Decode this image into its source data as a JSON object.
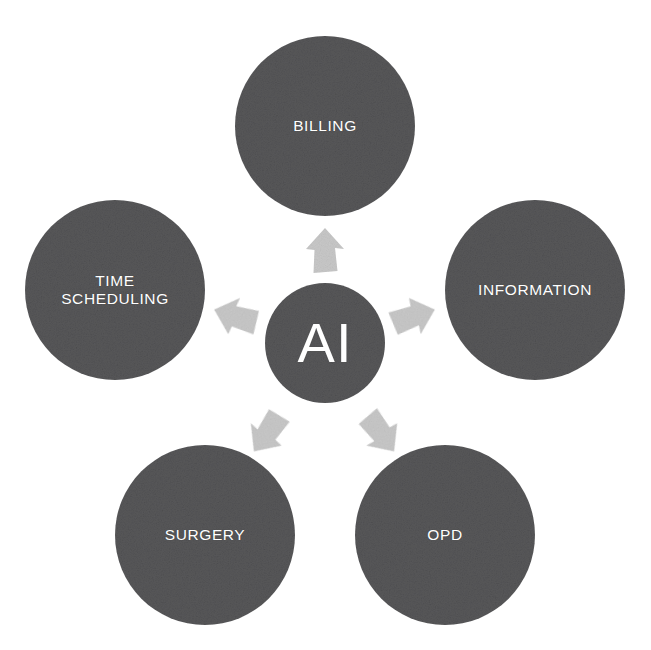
{
  "diagram": {
    "type": "hub-and-spoke radial diagram",
    "background_color": "#ffffff",
    "node_fill_color": "#58585a",
    "node_text_color": "#ffffff",
    "arrow_color": "#c8c8c8",
    "center": {
      "label": "AI",
      "cx": 325,
      "cy": 343,
      "r": 60
    },
    "nodes": [
      {
        "id": "billing",
        "label": "BILLING",
        "cx": 325,
        "cy": 126,
        "r": 90,
        "angle_deg": 90
      },
      {
        "id": "information",
        "label": "INFORMATION",
        "cx": 535,
        "cy": 290,
        "r": 90,
        "angle_deg": 18
      },
      {
        "id": "opd",
        "label": "OPD",
        "cx": 445,
        "cy": 535,
        "r": 90,
        "angle_deg": -54
      },
      {
        "id": "surgery",
        "label": "SURGERY",
        "cx": 205,
        "cy": 535,
        "r": 90,
        "angle_deg": -126
      },
      {
        "id": "time-scheduling",
        "label": "TIME\nSCHEDULING",
        "cx": 115,
        "cy": 290,
        "r": 90,
        "angle_deg": 162
      }
    ],
    "arrows": [
      {
        "id": "arrow-to-billing",
        "target": "billing",
        "cx": 325,
        "cy": 252,
        "rotation_deg": 0
      },
      {
        "id": "arrow-to-information",
        "target": "information",
        "cx": 412,
        "cy": 317,
        "rotation_deg": 72
      },
      {
        "id": "arrow-to-opd",
        "target": "opd",
        "cx": 380,
        "cy": 432,
        "rotation_deg": 144
      },
      {
        "id": "arrow-to-surgery",
        "target": "surgery",
        "cx": 268,
        "cy": 432,
        "rotation_deg": -144
      },
      {
        "id": "arrow-to-time-scheduling",
        "target": "time-scheduling",
        "cx": 237,
        "cy": 317,
        "rotation_deg": -72
      }
    ]
  }
}
